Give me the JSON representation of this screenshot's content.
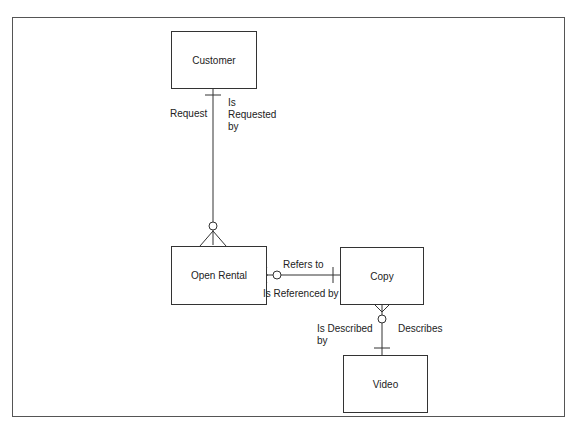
{
  "entities": {
    "customer": {
      "label": "Customer"
    },
    "open_rental": {
      "label": "Open Rental"
    },
    "copy": {
      "label": "Copy"
    },
    "video": {
      "label": "Video"
    }
  },
  "relationships": [
    {
      "from": "Customer",
      "to": "Open Rental",
      "from_label": "Request",
      "to_label": "Is\nRequested\nby",
      "from_cardinality": "one",
      "to_cardinality": "zero-or-many"
    },
    {
      "from": "Open Rental",
      "to": "Copy",
      "from_label": "Refers to",
      "to_label": "Is Referenced by",
      "from_cardinality": "zero-or-many",
      "to_cardinality": "one"
    },
    {
      "from": "Video",
      "to": "Copy",
      "from_label": "Describes",
      "to_label": "Is Described\nby",
      "from_cardinality": "one",
      "to_cardinality": "zero-or-many"
    }
  ],
  "labels": {
    "request": "Request",
    "is_requested_by": "Is\nRequested\nby",
    "refers_to": "Refers to",
    "is_referenced_by": "Is Referenced by",
    "is_described_by": "Is Described\nby",
    "describes": "Describes"
  }
}
